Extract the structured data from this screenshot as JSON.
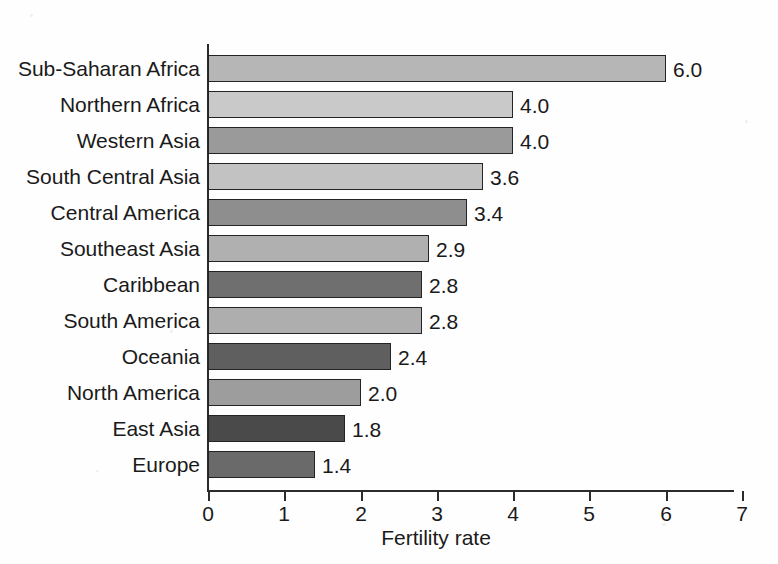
{
  "chart_data": {
    "type": "bar",
    "orientation": "horizontal",
    "title": "",
    "xlabel": "Fertility rate",
    "ylabel": "",
    "xlim": [
      0,
      7
    ],
    "xticks": [
      "0",
      "1",
      "2",
      "3",
      "4",
      "5",
      "6",
      "7"
    ],
    "grid": false,
    "legend": "none",
    "categories": [
      "Sub-Saharan Africa",
      "Northern Africa",
      "Western Asia",
      "South Central Asia",
      "Central America",
      "Southeast Asia",
      "Caribbean",
      "South America",
      "Oceania",
      "North America",
      "East Asia",
      "Europe"
    ],
    "values": [
      6.0,
      4.0,
      4.0,
      3.6,
      3.4,
      2.9,
      2.8,
      2.8,
      2.4,
      2.0,
      1.8,
      1.4
    ],
    "value_labels": [
      "6.0",
      "4.0",
      "4.0",
      "3.6",
      "3.4",
      "2.9",
      "2.8",
      "2.8",
      "2.4",
      "2.0",
      "1.8",
      "1.4"
    ],
    "bar_colors": [
      "#b6b6b6",
      "#c9c9c9",
      "#9a9a9a",
      "#c2c2c2",
      "#8e8e8e",
      "#b0b0b0",
      "#6f6f6f",
      "#aeaeae",
      "#5f5f5f",
      "#9d9d9d",
      "#4a4a4a",
      "#6a6a6a"
    ],
    "bar_edge_color": "#242424",
    "axis_color": "#2b2b2b",
    "background_color": "#fefefe",
    "text_color": "#1a1a1a"
  }
}
